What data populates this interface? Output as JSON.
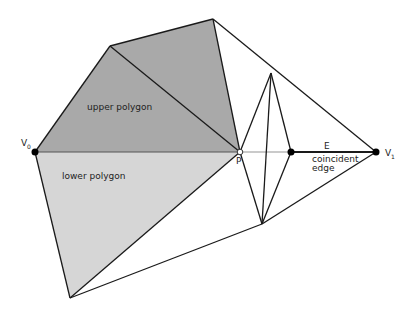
{
  "diagram": {
    "colors": {
      "upper_fill": "#a9a9a9",
      "lower_fill": "#d6d6d6",
      "stroke": "#1a1a1a",
      "baseline": "#b8b8b8"
    },
    "vertices": {
      "V0": {
        "label": "V",
        "sub": "0",
        "x": 35,
        "y": 152
      },
      "V1": {
        "label": "V",
        "sub": "1",
        "x": 376,
        "y": 152
      },
      "P": {
        "label": "P",
        "x": 240,
        "y": 152
      },
      "E_start": {
        "x": 291,
        "y": 152
      }
    },
    "labels": {
      "upper_polygon": "upper polygon",
      "lower_polygon": "lower polygon",
      "edge_name": "E",
      "coincident_line1": "coincident",
      "coincident_line2": "edge",
      "v0_main": "V",
      "v0_sub": "0",
      "v1_main": "V",
      "v1_sub": "1",
      "p_label": "P"
    }
  }
}
